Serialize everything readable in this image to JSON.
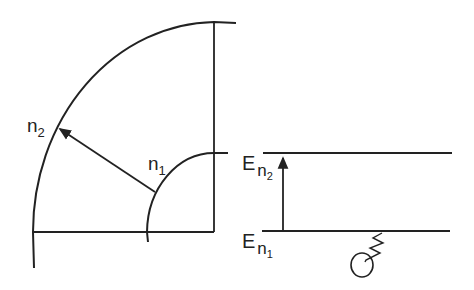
{
  "diagram": {
    "left_panel": {
      "description": "Quarter-circle cross-section with two radii",
      "outer_label": "n",
      "outer_sub": "2",
      "inner_label": "n",
      "inner_sub": "1"
    },
    "right_panel": {
      "description": "Energy level diagram",
      "upper_level_label": "E",
      "upper_level_sub_main": "n",
      "upper_level_sub_sub": "2",
      "lower_level_label": "E",
      "lower_level_sub_main": "n",
      "lower_level_sub_sub": "1",
      "transition": "upward arrow from lower to upper level",
      "photon_source": "circle with zigzag line (absorbed photon)"
    },
    "stroke_color": "#222222"
  }
}
